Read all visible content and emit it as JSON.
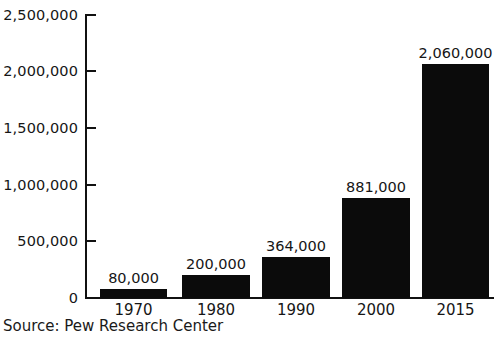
{
  "chart_data": {
    "type": "bar",
    "title": "",
    "subtitle": "",
    "xlabel": "",
    "ylabel": "",
    "categories": [
      "1970",
      "1980",
      "1990",
      "2000",
      "2015"
    ],
    "values": [
      80000,
      200000,
      364000,
      881000,
      2060000
    ],
    "value_labels": [
      "80,000",
      "200,000",
      "364,000",
      "881,000",
      "2,060,000"
    ],
    "ylim": [
      0,
      2500000
    ],
    "yticks": [
      0,
      500000,
      1000000,
      1500000,
      2000000,
      2500000
    ],
    "ytick_labels": [
      "0",
      "500,000",
      "1,000,000",
      "1,500,000",
      "2,000,000",
      "2,500,000"
    ],
    "grid": false,
    "legend": false,
    "legend_position": "none",
    "bar_color": "#0b0b0b",
    "axis_color": "#111111",
    "background_color": "#ffffff",
    "data_labels_shown": true
  },
  "source": {
    "text": "Source: Pew Research Center"
  }
}
